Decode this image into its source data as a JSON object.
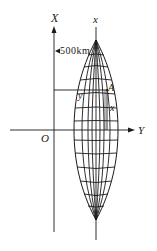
{
  "diagram": {
    "type": "gauss-kruger-projection-zone",
    "axes": {
      "vertical_label": "X",
      "horizontal_label": "Y",
      "origin_label": "O"
    },
    "central_meridian_label": "x",
    "offset_annotation": "500km",
    "point": {
      "label": "A",
      "y_label": "y",
      "x_label": "x"
    },
    "colors": {
      "line": "#1a1a1a",
      "background": "#ffffff"
    }
  }
}
